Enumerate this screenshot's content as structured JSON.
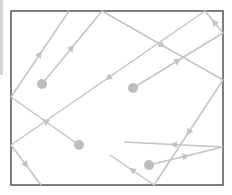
{
  "diagram": {
    "type": "ray-reflection-box",
    "box": {
      "x": 11,
      "y": 11,
      "width": 212,
      "height": 174,
      "stroke": "#555555"
    },
    "ray_color": "#c4c4c4",
    "dot_color": "#bdbdbd",
    "sources": [
      {
        "x": 42,
        "y": 84
      },
      {
        "x": 133,
        "y": 88
      },
      {
        "x": 79,
        "y": 145
      },
      {
        "x": 149,
        "y": 165
      }
    ],
    "segments": [
      {
        "x1": 42,
        "y1": 84,
        "x2": 102,
        "y2": 11,
        "arrow": true
      },
      {
        "x1": 102,
        "y1": 11,
        "x2": 223,
        "y2": 80,
        "arrow": true
      },
      {
        "x1": 223,
        "y1": 80,
        "x2": 154,
        "y2": 185,
        "arrow": true
      },
      {
        "x1": 154,
        "y1": 185,
        "x2": 110,
        "y2": 155,
        "arrow": true
      },
      {
        "x1": 11,
        "y1": 97,
        "x2": 69,
        "y2": 11,
        "arrow": true
      },
      {
        "x1": 133,
        "y1": 88,
        "x2": 223,
        "y2": 33,
        "arrow": true
      },
      {
        "x1": 223,
        "y1": 33,
        "x2": 205,
        "y2": 11,
        "arrow": true
      },
      {
        "x1": 205,
        "y1": 11,
        "x2": 11,
        "y2": 145,
        "arrow": true
      },
      {
        "x1": 11,
        "y1": 145,
        "x2": 41,
        "y2": 185,
        "arrow": true
      },
      {
        "x1": 79,
        "y1": 145,
        "x2": 11,
        "y2": 97,
        "arrow": true
      },
      {
        "x1": 149,
        "y1": 165,
        "x2": 223,
        "y2": 147,
        "arrow": true
      },
      {
        "x1": 223,
        "y1": 147,
        "x2": 124,
        "y2": 142,
        "arrow": true
      }
    ]
  }
}
